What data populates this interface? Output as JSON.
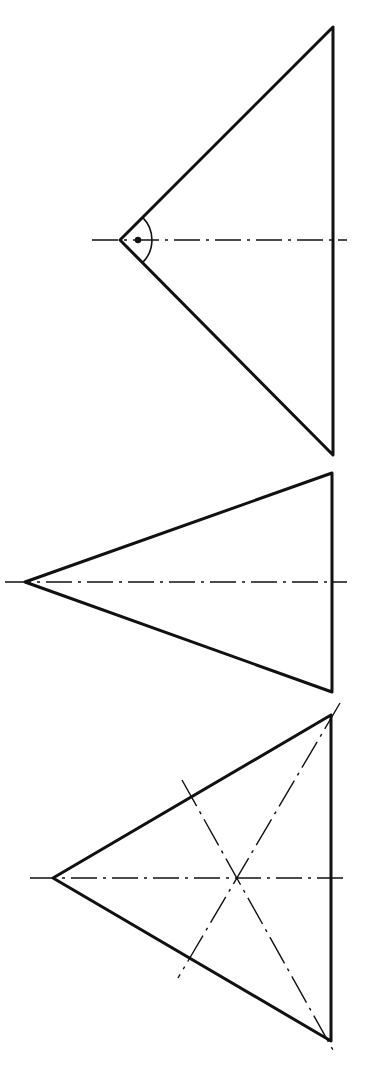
{
  "figure": {
    "colors": {
      "background": "#ffffff",
      "ink": "#111111"
    },
    "triangles": [
      {
        "id": "right-angle-triangle",
        "apex": [
          120,
          240
        ],
        "top": [
          333,
          27
        ],
        "bottom": [
          333,
          455
        ],
        "centerline": [
          [
            92,
            240
          ],
          [
            347,
            240
          ]
        ],
        "right_angle_mark": {
          "arc_radius": 32,
          "dot": [
            138,
            240
          ]
        }
      },
      {
        "id": "acute-triangle",
        "apex": [
          25,
          582
        ],
        "top": [
          332,
          473
        ],
        "bottom": [
          332,
          692
        ],
        "centerline": [
          [
            5,
            582
          ],
          [
            347,
            582
          ]
        ]
      },
      {
        "id": "bisector-triangle",
        "apex": [
          53,
          878
        ],
        "top": [
          331,
          715
        ],
        "bottom": [
          331,
          1041
        ],
        "centerline": [
          [
            30,
            878
          ],
          [
            347,
            878
          ]
        ],
        "bisectors": [
          [
            [
              182,
              780
            ],
            [
              333,
              1050
            ]
          ],
          [
            [
              340,
              703
            ],
            [
              178,
              978
            ]
          ]
        ],
        "incenter": [
          238,
          878
        ]
      }
    ]
  }
}
